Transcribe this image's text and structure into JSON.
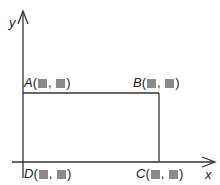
{
  "axes": {
    "x_label": "x",
    "y_label": "y"
  },
  "points": [
    {
      "name": "A",
      "open": "(",
      "sep": ", ",
      "close": ")"
    },
    {
      "name": "B",
      "open": "(",
      "sep": ", ",
      "close": ")"
    },
    {
      "name": "C",
      "open": "(",
      "sep": ", ",
      "close": ")"
    },
    {
      "name": "D",
      "open": "(",
      "sep": ", ",
      "close": ")"
    }
  ],
  "colors": {
    "line": "#333333",
    "placeholder": "#8a8a8a"
  }
}
